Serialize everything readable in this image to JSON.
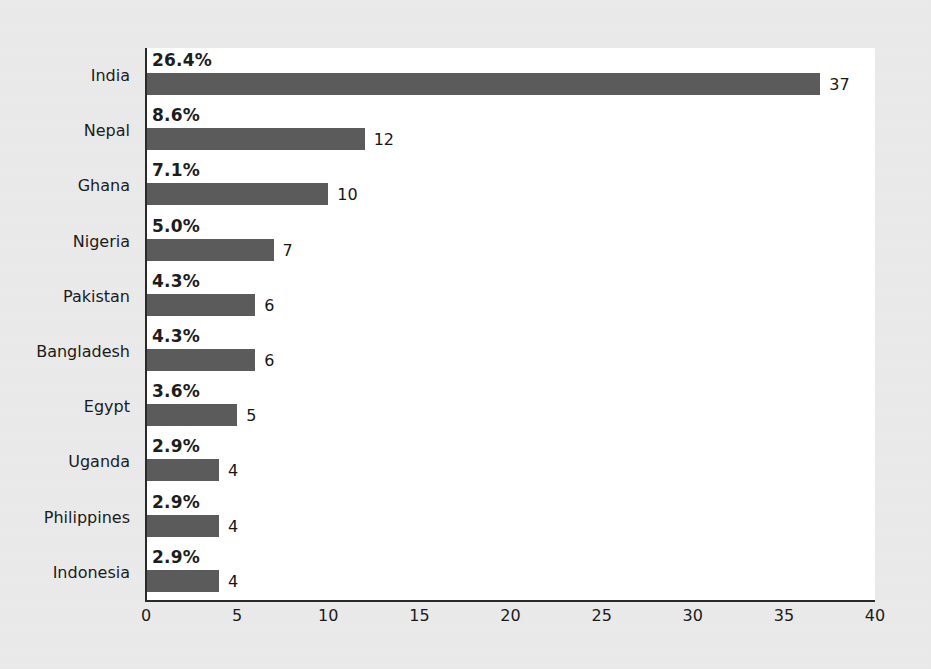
{
  "chart_data": {
    "type": "bar",
    "orientation": "horizontal",
    "title": "",
    "xlabel": "",
    "ylabel": "",
    "xlim": [
      0,
      40
    ],
    "xticks": [
      0,
      5,
      10,
      15,
      20,
      25,
      30,
      35,
      40
    ],
    "grid": false,
    "legend": null,
    "categories": [
      "India",
      "Nepal",
      "Ghana",
      "Nigeria",
      "Pakistan",
      "Bangladesh",
      "Egypt",
      "Uganda",
      "Philippines",
      "Indonesia"
    ],
    "values": [
      37,
      12,
      10,
      7,
      6,
      6,
      5,
      4,
      4,
      4
    ],
    "value_labels": [
      "37",
      "12",
      "10",
      "7",
      "6",
      "6",
      "5",
      "4",
      "4",
      "4"
    ],
    "percent_labels": [
      "26.4%",
      "8.6%",
      "7.1%",
      "5.0%",
      "4.3%",
      "4.3%",
      "3.6%",
      "2.9%",
      "2.9%",
      "2.9%"
    ],
    "percent_values": [
      26.4,
      8.6,
      7.1,
      5.0,
      4.3,
      4.3,
      3.6,
      2.9,
      2.9,
      2.9
    ],
    "colors": {
      "bar": "#5b5b5b",
      "axis": "#2a2a2a",
      "text": "#1b1b1b",
      "plot_background": "#ffffff",
      "page_background": "#ececed"
    }
  }
}
